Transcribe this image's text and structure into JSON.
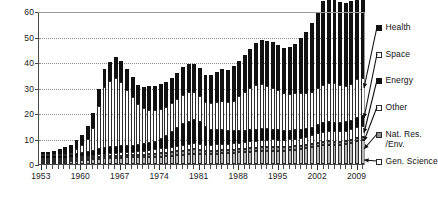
{
  "chart_data": {
    "type": "bar",
    "stacked": true,
    "title": "",
    "subtitle": "",
    "xlabel": "",
    "ylabel": "",
    "ylim": [
      0,
      60
    ],
    "yticks": [
      0,
      10,
      20,
      30,
      40,
      50,
      60
    ],
    "ytick_labels": [
      "0",
      "10",
      "20",
      "30",
      "40",
      "50",
      "60"
    ],
    "grid": "horizontal-dotted",
    "legend_position": "right",
    "x": [
      1953,
      1954,
      1955,
      1956,
      1957,
      1958,
      1959,
      1960,
      1961,
      1962,
      1963,
      1964,
      1965,
      1966,
      1967,
      1968,
      1969,
      1970,
      1971,
      1972,
      1973,
      1974,
      1975,
      1976,
      1977,
      1978,
      1979,
      1980,
      1981,
      1982,
      1983,
      1984,
      1985,
      1986,
      1987,
      1988,
      1989,
      1990,
      1991,
      1992,
      1993,
      1994,
      1995,
      1996,
      1997,
      1998,
      1999,
      2000,
      2001,
      2002,
      2003,
      2004,
      2005,
      2006,
      2007,
      2008,
      2009,
      2010
    ],
    "xtick_labels": [
      "1953",
      "1960",
      "1967",
      "1974",
      "1981",
      "1988",
      "1995",
      "2002",
      "2009"
    ],
    "xtick_values": [
      1953,
      1960,
      1967,
      1974,
      1981,
      1988,
      1995,
      2002,
      2009
    ],
    "series": [
      {
        "name": "Gen. Science",
        "color": "#b9b9b9",
        "values": [
          0.5,
          0.6,
          0.7,
          0.8,
          0.9,
          1.0,
          1.2,
          1.4,
          1.6,
          1.8,
          2.0,
          2.2,
          2.3,
          2.4,
          2.5,
          2.6,
          2.6,
          2.6,
          2.7,
          2.8,
          2.8,
          2.9,
          3.0,
          3.2,
          3.4,
          3.6,
          3.8,
          3.9,
          3.9,
          3.8,
          3.9,
          4.0,
          4.2,
          4.2,
          4.4,
          4.6,
          4.7,
          4.8,
          5.0,
          5.1,
          5.1,
          5.2,
          5.2,
          5.2,
          5.4,
          5.6,
          5.8,
          6.1,
          6.5,
          7.0,
          7.4,
          7.6,
          7.6,
          7.6,
          7.9,
          8.3,
          9.0,
          9.3
        ]
      },
      {
        "name": "Nat. Res./Env.",
        "color": "#8f8f8f",
        "values": [
          0.2,
          0.2,
          0.3,
          0.3,
          0.3,
          0.3,
          0.4,
          0.4,
          0.5,
          0.5,
          0.6,
          0.6,
          0.7,
          0.7,
          0.8,
          0.8,
          0.8,
          0.9,
          1.0,
          1.1,
          1.2,
          1.3,
          1.4,
          1.5,
          1.6,
          1.7,
          1.8,
          1.8,
          1.6,
          1.4,
          1.3,
          1.3,
          1.3,
          1.2,
          1.2,
          1.2,
          1.2,
          1.3,
          1.3,
          1.4,
          1.4,
          1.4,
          1.4,
          1.3,
          1.3,
          1.3,
          1.3,
          1.3,
          1.3,
          1.3,
          1.3,
          1.3,
          1.2,
          1.2,
          1.2,
          1.2,
          1.3,
          1.3
        ]
      },
      {
        "name": "Other",
        "color": "#ffffff",
        "values": [
          0.3,
          0.3,
          0.4,
          0.4,
          0.5,
          0.5,
          0.6,
          0.7,
          0.8,
          0.9,
          1.0,
          1.1,
          1.2,
          1.3,
          1.4,
          1.4,
          1.4,
          1.5,
          1.6,
          1.7,
          1.8,
          1.9,
          2.0,
          2.1,
          2.2,
          2.3,
          2.4,
          2.5,
          2.4,
          2.3,
          2.3,
          2.4,
          2.5,
          2.4,
          2.5,
          2.6,
          2.7,
          2.8,
          2.9,
          3.0,
          3.1,
          3.1,
          3.0,
          3.0,
          3.0,
          3.1,
          3.2,
          3.3,
          3.5,
          3.8,
          4.0,
          4.1,
          4.1,
          4.0,
          4.0,
          4.1,
          4.3,
          4.4
        ]
      },
      {
        "name": "Energy",
        "color": "#111111",
        "values": [
          0.3,
          0.4,
          0.5,
          0.6,
          0.8,
          1.0,
          1.2,
          1.4,
          1.6,
          1.8,
          2.0,
          2.1,
          2.2,
          2.3,
          2.4,
          2.4,
          2.4,
          2.4,
          2.5,
          2.7,
          2.9,
          3.6,
          4.6,
          5.6,
          6.8,
          8.0,
          8.6,
          8.9,
          8.4,
          7.0,
          6.0,
          5.6,
          5.4,
          5.0,
          4.8,
          4.6,
          4.5,
          4.4,
          4.3,
          4.2,
          4.0,
          3.8,
          3.6,
          3.4,
          3.3,
          3.2,
          3.1,
          3.0,
          3.0,
          3.1,
          3.2,
          3.3,
          3.2,
          3.2,
          3.2,
          3.3,
          3.6,
          3.7
        ]
      },
      {
        "name": "Space",
        "color": "#ffffff",
        "values": [
          0.1,
          0.1,
          0.2,
          0.3,
          0.4,
          0.8,
          2.0,
          3.0,
          5.0,
          9.0,
          17.0,
          24.0,
          26.0,
          27.0,
          25.0,
          22.0,
          19.0,
          16.0,
          14.0,
          13.0,
          12.5,
          12.0,
          11.5,
          11.5,
          11.5,
          11.5,
          11.5,
          11.0,
          10.5,
          10.0,
          10.5,
          11.0,
          11.5,
          11.5,
          12.0,
          13.5,
          15.0,
          16.5,
          17.5,
          17.5,
          17.0,
          16.5,
          16.0,
          15.0,
          14.5,
          14.5,
          14.5,
          14.0,
          14.0,
          14.5,
          15.0,
          15.5,
          15.5,
          15.0,
          14.5,
          14.5,
          15.0,
          15.0
        ]
      },
      {
        "name": "Health",
        "color": "#111111",
        "values": [
          0.6,
          0.9,
          1.2,
          1.8,
          2.5,
          3.0,
          3.5,
          4.2,
          5.0,
          5.8,
          6.5,
          7.0,
          7.5,
          8.0,
          8.3,
          8.2,
          8.0,
          7.8,
          8.5,
          9.5,
          9.5,
          9.8,
          9.5,
          10.0,
          10.2,
          10.8,
          11.2,
          11.3,
          11.0,
          10.5,
          11.0,
          11.8,
          12.5,
          12.5,
          13.5,
          14.0,
          14.5,
          15.5,
          16.5,
          17.5,
          17.5,
          17.8,
          17.5,
          17.5,
          18.5,
          19.5,
          21.5,
          24.0,
          27.0,
          30.0,
          33.0,
          33.5,
          33.0,
          32.5,
          32.5,
          32.5,
          33.5,
          33.5
        ]
      }
    ],
    "legend": [
      {
        "label": "Health",
        "swatch": "filled-black"
      },
      {
        "label": "Space",
        "swatch": "open-white"
      },
      {
        "label": "Energy",
        "swatch": "filled-black"
      },
      {
        "label": "Other",
        "swatch": "open-white"
      },
      {
        "label": "Nat. Res.\n/Env.",
        "swatch": "filled-gray"
      },
      {
        "label": "Gen. Science",
        "swatch": "open-white"
      }
    ]
  },
  "legend_rows": [
    {
      "label": "Health",
      "line2": ""
    },
    {
      "label": "Space",
      "line2": ""
    },
    {
      "label": "Energy",
      "line2": ""
    },
    {
      "label": "Other",
      "line2": ""
    },
    {
      "label": "Nat. Res.",
      "line2": "/Env."
    },
    {
      "label": "Gen. Science",
      "line2": ""
    }
  ]
}
